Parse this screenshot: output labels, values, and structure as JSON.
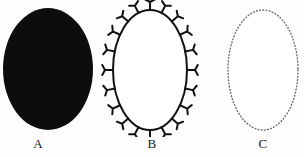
{
  "figure": {
    "background_color": "#fdfdfd",
    "ink_color": "#111111",
    "dot_color": "#5a5a5a",
    "panels": [
      {
        "id": "a",
        "label": "A",
        "shape": "ellipse",
        "style": "solid-filled",
        "fill_color": "#0d0d0d",
        "stroke_color": "#0d0d0d",
        "center_x": 48,
        "center_y": 69,
        "radius_x": 45,
        "radius_y": 61,
        "stroke_width": 0,
        "marks": 0
      },
      {
        "id": "b",
        "label": "B",
        "shape": "ellipse",
        "style": "outline-with-receptors",
        "fill_color": "#ffffff",
        "stroke_color": "#111111",
        "center_x": 50,
        "center_y": 70,
        "radius_x": 37,
        "radius_y": 60,
        "stroke_width": 2,
        "marks": 20,
        "mark_glyph": "Y",
        "mark_name": "receptor-mark",
        "mark_length": 8,
        "mark_arm_spread": 5
      },
      {
        "id": "c",
        "label": "C",
        "shape": "ellipse",
        "style": "dotted-outline",
        "fill_color": "#ffffff",
        "stroke_color": "#6a6a6a",
        "center_x": 63,
        "center_y": 70,
        "radius_x": 35,
        "radius_y": 60,
        "stroke_width": 1.4,
        "dash_pattern": "0.8 2.4",
        "marks": 0
      }
    ]
  },
  "chart_data": {
    "type": "diagram",
    "title": "",
    "subtitle": "",
    "categories": [
      "A",
      "B",
      "C"
    ],
    "series": [
      {
        "name": "cell-surface-representation",
        "values": [
          "solid filled ellipse",
          "outlined ellipse with Y-shaped surface receptors",
          "dotted outline ellipse"
        ]
      }
    ],
    "annotations": [
      "A",
      "B",
      "C"
    ],
    "legend_position": "none",
    "grid": false
  }
}
